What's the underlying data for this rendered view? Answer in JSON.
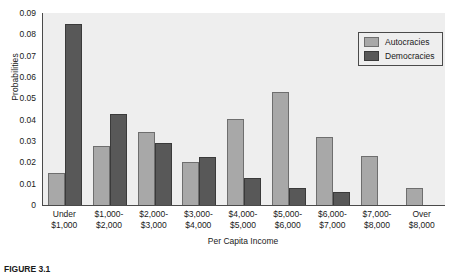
{
  "chart_data": {
    "type": "bar",
    "title": "",
    "xlabel": "Per Capita Income",
    "ylabel": "Probabilities",
    "ylim": [
      0,
      0.09
    ],
    "yticks": [
      "0",
      "0.01",
      "0.02",
      "0.03",
      "0.04",
      "0.05",
      "0.06",
      "0.07",
      "0.08",
      "0.09"
    ],
    "ytick_values": [
      0,
      0.01,
      0.02,
      0.03,
      0.04,
      0.05,
      0.06,
      0.07,
      0.08,
      0.09
    ],
    "grid": false,
    "legend_position": "top-right",
    "categories": [
      "Under $1,000",
      "$1,000-$2,000",
      "$2,000-$3,000",
      "$3,000-$4,000",
      "$4,000-$5,000",
      "$5,000-$6,000",
      "$6,000-$7,000",
      "$7,000-$8,000",
      "Over $8,000"
    ],
    "category_lines": [
      [
        "Under",
        "$1,000"
      ],
      [
        "$1,000-",
        "$2,000"
      ],
      [
        "$2,000-",
        "$3,000"
      ],
      [
        "$3,000-",
        "$4,000"
      ],
      [
        "$4,000-",
        "$5,000"
      ],
      [
        "$5,000-",
        "$6,000"
      ],
      [
        "$6,000-",
        "$7,000"
      ],
      [
        "$7,000-",
        "$8,000"
      ],
      [
        "Over",
        "$8,000"
      ]
    ],
    "series": [
      {
        "name": "Autocracies",
        "color": "#a8a8a8",
        "values": [
          0.015,
          0.0275,
          0.034,
          0.02,
          0.0405,
          0.053,
          0.032,
          0.023,
          0.008
        ]
      },
      {
        "name": "Democracies",
        "color": "#585858",
        "values": [
          0.085,
          0.0425,
          0.029,
          0.0225,
          0.0125,
          0.008,
          0.006,
          0,
          0
        ]
      }
    ]
  },
  "legend": {
    "items": [
      {
        "label": "Autocracies"
      },
      {
        "label": "Democracies"
      }
    ]
  },
  "caption": {
    "text": "FIGURE 3.1"
  },
  "colors": {
    "autocracies": "#a8a8a8",
    "democracies": "#585858",
    "plot_background": "#eeeeee",
    "axis": "#4a4a4a"
  }
}
